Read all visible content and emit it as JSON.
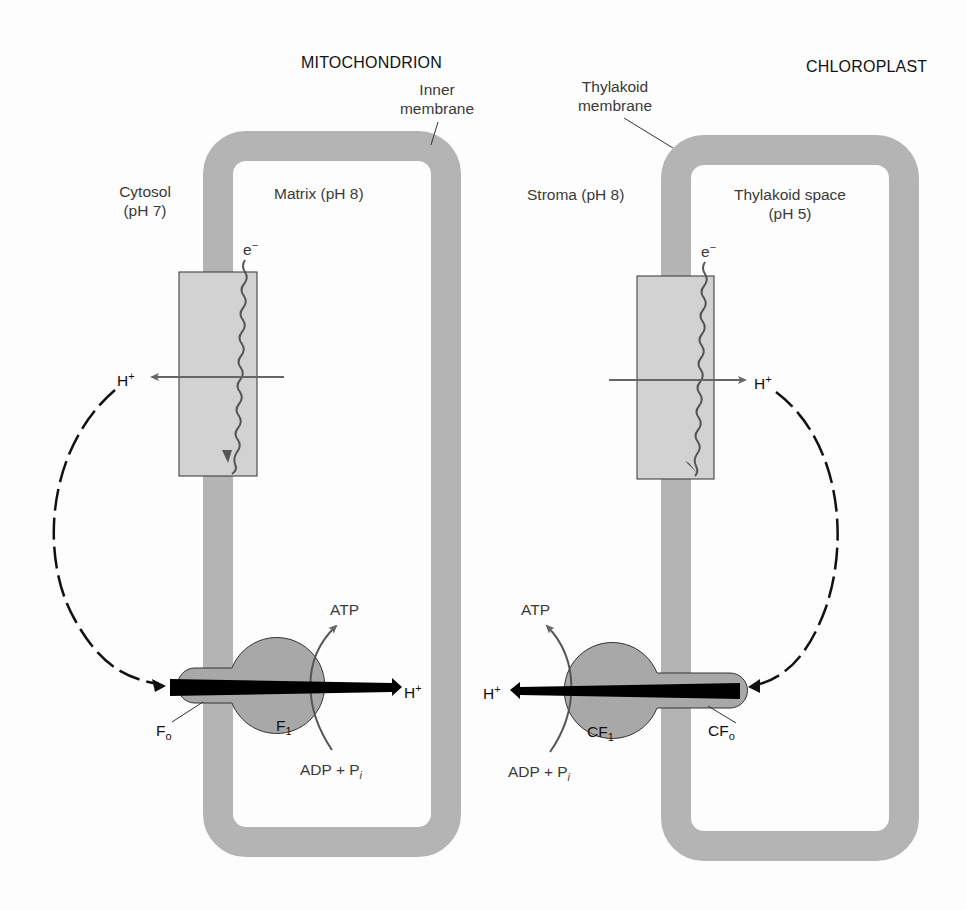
{
  "diagram": {
    "mitochondrion": {
      "title": "MITOCHONDRION",
      "membrane_label_line1": "Inner",
      "membrane_label_line2": "membrane",
      "outside_label_line1": "Cytosol",
      "outside_label_line2": "(pH 7)",
      "inside_label": "Matrix (pH 8)",
      "electron": "e",
      "electron_sup": "−",
      "proton_pumped": "H",
      "proton_pumped_sup": "+",
      "proton_through_synthase": "H",
      "proton_through_synthase_sup": "+",
      "atp": "ATP",
      "adp": "ADP + P",
      "adp_sub": "i",
      "fo": "F",
      "fo_sub": "o",
      "f1": "F",
      "f1_sub": "1"
    },
    "chloroplast": {
      "title": "CHLOROPLAST",
      "membrane_label_line1": "Thylakoid",
      "membrane_label_line2": "membrane",
      "outside_label": "Stroma (pH 8)",
      "inside_label_line1": "Thylakoid space",
      "inside_label_line2": "(pH 5)",
      "electron": "e",
      "electron_sup": "−",
      "proton_pumped": "H",
      "proton_pumped_sup": "+",
      "proton_through_synthase": "H",
      "proton_through_synthase_sup": "+",
      "atp": "ATP",
      "adp": "ADP + P",
      "adp_sub": "i",
      "cfo": "CF",
      "cfo_sub": "o",
      "cf1": "CF",
      "cf1_sub": "1"
    },
    "colors": {
      "membrane": "#b4b4b4",
      "complex_box": "#d2d2d2",
      "synthase": "#a8a8a8",
      "gray_arrow": "#666666",
      "black_arrow": "#000000"
    }
  }
}
